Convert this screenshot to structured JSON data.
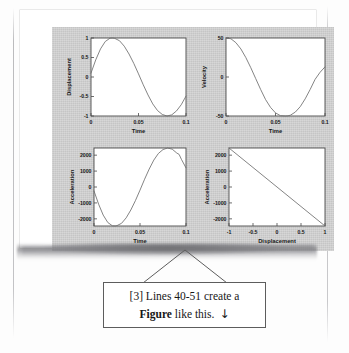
{
  "page": {
    "background_color": "#ffffff",
    "figure_panel_color": "#d3d3d3",
    "line_color": "#6e6e6e",
    "axis_color": "#4a4a4a",
    "text_color": "#171717"
  },
  "callout": {
    "line1": "[3] Lines 40-51 create a",
    "line2_bold": "Figure",
    "line2_rest": " like this.",
    "arrow": "↓",
    "border_color": "#5d5d5d"
  },
  "chart_data": [
    {
      "id": "displacement-vs-time",
      "type": "line",
      "title": "",
      "xlabel": "Time",
      "ylabel": "Displacement",
      "xlim": [
        0,
        0.1
      ],
      "ylim": [
        -1,
        1
      ],
      "xticks": [
        0,
        0.05,
        0.1
      ],
      "xticklabels": [
        "0",
        "0.05",
        "0.1"
      ],
      "yticks": [
        -1,
        -0.5,
        0,
        0.5,
        1
      ],
      "yticklabels": [
        "-1",
        "-0.5",
        "0",
        "0.5",
        "1"
      ],
      "grid": false,
      "legend": null,
      "x": [
        0,
        0.005,
        0.01,
        0.015,
        0.02,
        0.023,
        0.025,
        0.03,
        0.035,
        0.04,
        0.045,
        0.05,
        0.055,
        0.06,
        0.065,
        0.07,
        0.075,
        0.08,
        0.085,
        0.09,
        0.095,
        0.1
      ],
      "y": [
        0.1,
        0.44,
        0.72,
        0.91,
        0.995,
        1.0,
        0.99,
        0.93,
        0.79,
        0.59,
        0.35,
        0.08,
        -0.2,
        -0.46,
        -0.69,
        -0.86,
        -0.96,
        -1.0,
        -0.97,
        -0.87,
        -0.71,
        -0.49
      ]
    },
    {
      "id": "velocity-vs-time",
      "type": "line",
      "title": "",
      "xlabel": "Time",
      "ylabel": "Velocity",
      "xlim": [
        0,
        0.1
      ],
      "ylim": [
        -50,
        50
      ],
      "xticks": [
        0,
        0.05,
        0.1
      ],
      "xticklabels": [
        "0",
        "0.05",
        "0.1"
      ],
      "yticks": [
        -50,
        0,
        50
      ],
      "yticklabels": [
        "-50",
        "0",
        "50"
      ],
      "grid": false,
      "legend": null,
      "x": [
        0,
        0.005,
        0.01,
        0.015,
        0.02,
        0.025,
        0.03,
        0.035,
        0.04,
        0.045,
        0.05,
        0.055,
        0.06,
        0.0625,
        0.065,
        0.07,
        0.075,
        0.08,
        0.085,
        0.09,
        0.095,
        0.1
      ],
      "y": [
        50,
        49,
        44,
        36,
        25,
        12,
        -2,
        -16,
        -29,
        -39,
        -46,
        -49.6,
        -50,
        -49.8,
        -49,
        -45,
        -38,
        -28,
        -16,
        -3,
        6,
        13
      ]
    },
    {
      "id": "acceleration-vs-time",
      "type": "line",
      "title": "",
      "xlabel": "Time",
      "ylabel": "Acceleration",
      "xlim": [
        0,
        0.1
      ],
      "ylim": [
        -2450,
        2450
      ],
      "xticks": [
        0,
        0.05,
        0.1
      ],
      "xticklabels": [
        "0",
        "0.05",
        "0.1"
      ],
      "yticks": [
        -2000,
        -1000,
        0,
        1000,
        2000
      ],
      "yticklabels": [
        "-2000",
        "-1000",
        "0",
        "1000",
        "2000"
      ],
      "grid": false,
      "legend": null,
      "x": [
        0,
        0.005,
        0.01,
        0.015,
        0.02,
        0.023,
        0.025,
        0.03,
        0.035,
        0.04,
        0.045,
        0.05,
        0.055,
        0.06,
        0.065,
        0.07,
        0.075,
        0.08,
        0.085,
        0.09,
        0.0925,
        0.095,
        0.1
      ],
      "y": [
        -245,
        -1078,
        -1764,
        -2230,
        -2438,
        -2450,
        -2426,
        -2279,
        -1936,
        -1446,
        -858,
        -196,
        490,
        1127,
        1691,
        2107,
        2352,
        2450,
        2377,
        2132,
        2050,
        1740,
        1201
      ]
    },
    {
      "id": "acceleration-vs-displacement",
      "type": "line",
      "title": "",
      "xlabel": "Displacement",
      "ylabel": "Acceleration",
      "xlim": [
        -1,
        1
      ],
      "ylim": [
        -2450,
        2450
      ],
      "xticks": [
        -1,
        -0.5,
        0,
        0.5,
        1
      ],
      "xticklabels": [
        "-1",
        "-0.5",
        "0",
        "0.5",
        "1"
      ],
      "yticks": [
        -2000,
        -1000,
        0,
        1000,
        2000
      ],
      "yticklabels": [
        "-2000",
        "-1000",
        "0",
        "1000",
        "2000"
      ],
      "grid": false,
      "legend": null,
      "x": [
        -1,
        -0.5,
        0,
        0.5,
        1
      ],
      "y": [
        2450,
        1225,
        0,
        -1225,
        -2450
      ]
    }
  ]
}
